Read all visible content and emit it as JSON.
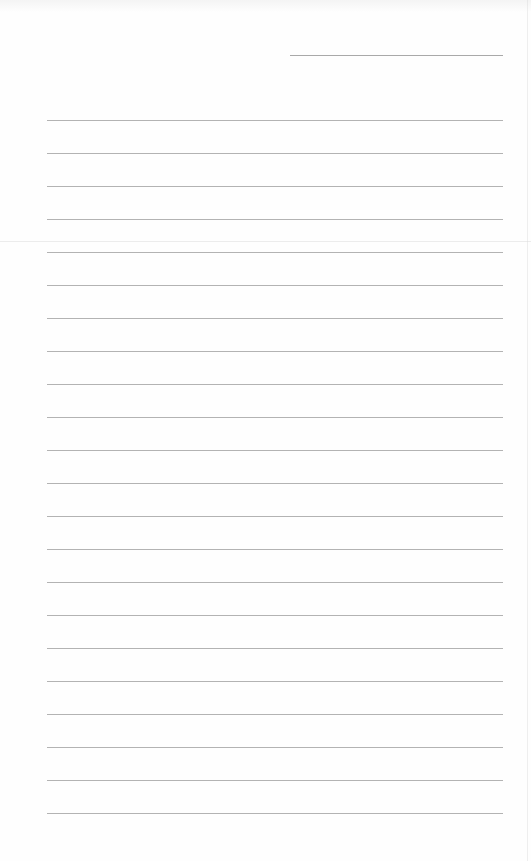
{
  "document": {
    "type": "lined-paper",
    "background_color": "#fefefe",
    "line_color": "#b3b3b3",
    "header_line": {
      "x_start": 290,
      "x_end": 503,
      "y": 55
    },
    "ruled_lines": {
      "count": 22,
      "x_start": 47,
      "x_end": 503,
      "first_y": 120,
      "spacing": 33
    }
  }
}
